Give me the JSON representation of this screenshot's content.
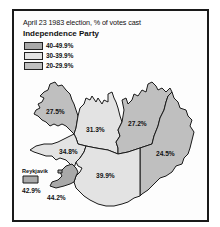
{
  "title": "April 23 1983 election, % of votes cast",
  "subtitle": "Independence Party",
  "colors": {
    "band_40_49": "#a9a9a9",
    "band_30_39": "#e3e3e3",
    "band_20_29": "#bfbfbf",
    "outline": "#1a1a1a"
  },
  "legend": [
    {
      "label": "40-49.9%",
      "band": "band_40_49"
    },
    {
      "label": "30-39.9%",
      "band": "band_30_39"
    },
    {
      "label": "20-29.9%",
      "band": "band_20_29"
    }
  ],
  "regions": [
    {
      "name": "Westfjords",
      "value": "27.5%",
      "band": "band_20_29"
    },
    {
      "name": "Northwest",
      "value": "31.3%",
      "band": "band_30_39"
    },
    {
      "name": "Northeast",
      "value": "27.2%",
      "band": "band_20_29"
    },
    {
      "name": "East",
      "value": "24.5%",
      "band": "band_20_29"
    },
    {
      "name": "West",
      "value": "34.8%",
      "band": "band_30_39"
    },
    {
      "name": "South",
      "value": "39.9%",
      "band": "band_30_39"
    },
    {
      "name": "Reykjanes",
      "value": "44.2%",
      "band": "band_40_49"
    },
    {
      "name": "Reykjavik",
      "value": "42.9%",
      "band": "band_40_49"
    }
  ],
  "reykjavik_label": "Reykjavik"
}
